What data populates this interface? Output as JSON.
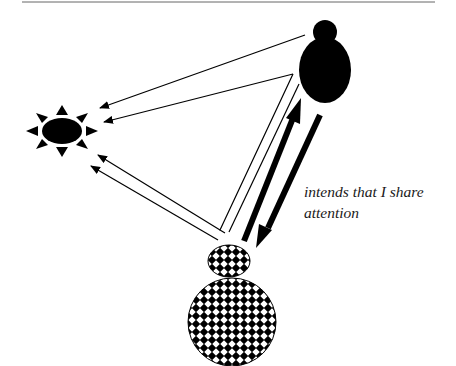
{
  "figure": {
    "caption_label": {
      "line1": "intends that I share",
      "line2": "attention"
    },
    "entities": [
      {
        "id": "adult",
        "description": "solid black figure (head + body)",
        "fill": "#000000"
      },
      {
        "id": "infant",
        "description": "checker-patterned figure (head + body)",
        "fill": "checker"
      },
      {
        "id": "object",
        "description": "black sun-like object with 8 rays",
        "fill": "#000000"
      }
    ],
    "arrows": [
      {
        "from": "adult",
        "to": "object",
        "style": "thin single line"
      },
      {
        "from": "adult",
        "to": "object",
        "style": "thin line via corner"
      },
      {
        "from": "infant",
        "to": "object",
        "style": "thin double line"
      },
      {
        "from": "infant",
        "to": "adult",
        "style": "thick"
      },
      {
        "from": "adult",
        "to": "infant",
        "style": "thick"
      }
    ],
    "colors": {
      "ink": "#000000",
      "background": "#ffffff",
      "rule": "#555555"
    }
  }
}
